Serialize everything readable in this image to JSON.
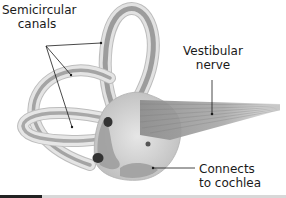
{
  "diagram": {
    "labels": {
      "semicircular_line1": "Semicircular",
      "semicircular_line2": "canals",
      "vestibular_line1": "Vestibular",
      "vestibular_line2": "nerve",
      "cochlea_line1": "Connects",
      "cochlea_line2": "to cochlea"
    },
    "colors": {
      "canal_outer": "#d9d9d9",
      "canal_inner": "#9a9a9a",
      "canal_edge": "#bdbdbd",
      "vestibule": "#c8c8c8",
      "nerve": "#8c8c8c",
      "ampulla": "#333333",
      "leader_line": "#1a1a1a",
      "bottom_bar_dark": "#222222",
      "bottom_bar_light": "#d8d8d8"
    }
  }
}
